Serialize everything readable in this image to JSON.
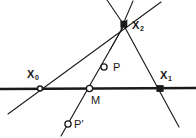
{
  "figure": {
    "type": "geometric-construction-diagram",
    "width": 196,
    "height": 138,
    "background_color": "#ffffff",
    "stroke_color": "#1a1a1a",
    "labels": {
      "x0": "X",
      "x0_sub": "0",
      "x1": "X",
      "x1_sub": "1",
      "x2": "X",
      "x2_sub": "2",
      "p": "P",
      "p_prime": "P'",
      "m": "M"
    },
    "points": [
      {
        "id": "X0",
        "label": "X0",
        "x": 40,
        "y": 88,
        "marker": "open-circle-small",
        "on": "baseline"
      },
      {
        "id": "M",
        "label": "M",
        "x": 90,
        "y": 88,
        "marker": "open-circle",
        "on": "baseline"
      },
      {
        "id": "X1",
        "label": "X1",
        "x": 160,
        "y": 88,
        "marker": "filled-square",
        "on": "baseline"
      },
      {
        "id": "X2",
        "label": "X2",
        "x": 124,
        "y": 24,
        "marker": "filled-square",
        "on": "apex"
      },
      {
        "id": "P",
        "label": "P",
        "x": 104,
        "y": 67,
        "marker": "open-circle",
        "on": "median-line"
      },
      {
        "id": "Pp",
        "label": "P'",
        "x": 68,
        "y": 124,
        "marker": "open-circle",
        "on": "median-line"
      }
    ],
    "lines": [
      {
        "id": "baseline",
        "from": [
          0,
          89
        ],
        "to": [
          196,
          88
        ],
        "weight": "thick"
      },
      {
        "id": "line-x0-x2",
        "from": [
          8,
          113
        ],
        "to": [
          160,
          3
        ],
        "weight": "thin"
      },
      {
        "id": "line-x2-x1",
        "from": [
          124,
          24
        ],
        "to": [
          178,
          125
        ],
        "weight": "thin"
      },
      {
        "id": "line-pp-x2",
        "from": [
          62,
          134
        ],
        "to": [
          126,
          22
        ],
        "weight": "thin"
      },
      {
        "id": "ray-x2-up",
        "from": [
          124,
          24
        ],
        "to": [
          134,
          2
        ],
        "weight": "thin"
      },
      {
        "id": "ray-x2-left",
        "from": [
          124,
          24
        ],
        "to": [
          108,
          0
        ],
        "weight": "thin"
      },
      {
        "id": "ray-x2-down",
        "from": [
          124,
          24
        ],
        "to": [
          112,
          48
        ],
        "weight": "thin"
      }
    ]
  }
}
